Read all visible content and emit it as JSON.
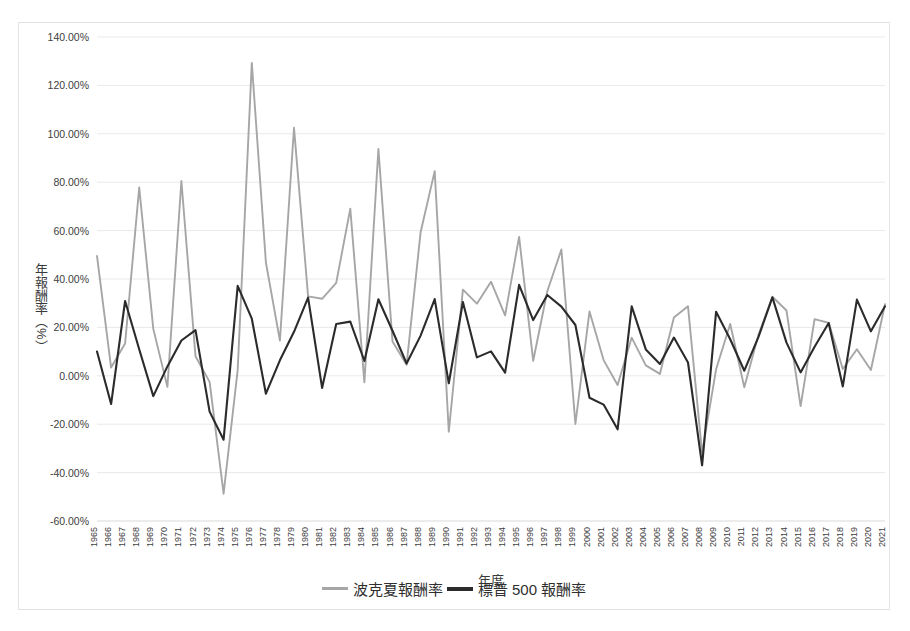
{
  "chart_data": {
    "type": "line",
    "title": "",
    "xlabel": "年度",
    "ylabel": "年報酬率（%）",
    "ylim": [
      -60,
      140
    ],
    "ytick_step": 20,
    "ytick_labels": [
      "140.00%",
      "120.00%",
      "100.00%",
      "80.00%",
      "60.00%",
      "40.00%",
      "20.00%",
      "0.00%",
      "-20.00%",
      "-40.00%",
      "-60.00%"
    ],
    "ytick_values": [
      140,
      120,
      100,
      80,
      60,
      40,
      20,
      0,
      -20,
      -40,
      -60
    ],
    "grid": true,
    "legend_position": "bottom",
    "categories": [
      1965,
      1966,
      1967,
      1968,
      1969,
      1970,
      1971,
      1972,
      1973,
      1974,
      1975,
      1976,
      1977,
      1978,
      1979,
      1980,
      1981,
      1982,
      1983,
      1984,
      1985,
      1986,
      1987,
      1988,
      1989,
      1990,
      1991,
      1992,
      1993,
      1994,
      1995,
      1996,
      1997,
      1998,
      1999,
      2000,
      2001,
      2002,
      2003,
      2004,
      2005,
      2006,
      2007,
      2008,
      2009,
      2010,
      2011,
      2012,
      2013,
      2014,
      2015,
      2016,
      2017,
      2018,
      2019,
      2020,
      2021
    ],
    "series": [
      {
        "name": "波克夏報酬率",
        "color": "#a6a6a6",
        "values": [
          49.5,
          3.4,
          13.3,
          77.8,
          19.4,
          -4.6,
          80.5,
          8.1,
          -2.5,
          -48.7,
          2.5,
          129.3,
          46.8,
          14.5,
          102.5,
          32.8,
          31.8,
          38.4,
          69.0,
          -2.7,
          93.7,
          14.2,
          4.6,
          59.3,
          84.6,
          -23.1,
          35.6,
          29.8,
          38.9,
          25.0,
          57.4,
          6.2,
          34.9,
          52.2,
          -19.9,
          26.6,
          6.5,
          -3.8,
          15.8,
          4.3,
          0.8,
          24.1,
          28.7,
          -31.8,
          2.7,
          21.4,
          -4.7,
          16.8,
          32.7,
          27.0,
          -12.5,
          23.4,
          21.9,
          2.8,
          11.0,
          2.4,
          29.6
        ]
      },
      {
        "name": "標普 500 報酬率",
        "color": "#2b2b2b",
        "values": [
          10.0,
          -11.7,
          30.9,
          11.0,
          -8.4,
          3.9,
          14.6,
          18.9,
          -14.8,
          -26.4,
          37.2,
          23.6,
          -7.4,
          6.4,
          18.2,
          32.3,
          -5.0,
          21.4,
          22.4,
          6.1,
          31.6,
          18.6,
          5.1,
          16.6,
          31.7,
          -3.1,
          30.5,
          7.6,
          10.1,
          1.3,
          37.6,
          23.0,
          33.4,
          28.6,
          21.0,
          -9.1,
          -11.9,
          -22.1,
          28.7,
          10.9,
          4.9,
          15.8,
          5.5,
          -37.0,
          26.5,
          15.1,
          2.1,
          16.0,
          32.4,
          13.7,
          1.4,
          12.0,
          21.8,
          -4.4,
          31.5,
          18.4,
          28.7
        ]
      }
    ]
  },
  "legend": {
    "items": [
      {
        "label": "波克夏報酬率",
        "color": "#a6a6a6"
      },
      {
        "label": "標普 500 報酬率",
        "color": "#2b2b2b"
      }
    ]
  }
}
